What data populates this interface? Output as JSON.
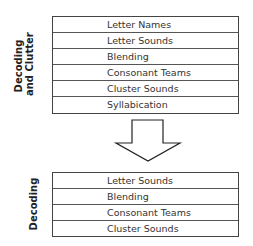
{
  "top_group": {
    "label_line1": "Decoding",
    "label_line2": "and Clutter",
    "rows": [
      "Letter Names",
      "Letter Sounds",
      "Blending",
      "Consonant Teams",
      "Cluster Sounds",
      "Syllabication"
    ]
  },
  "bottom_group": {
    "label": "Decoding",
    "rows": [
      "Letter Sounds",
      "Blending",
      "Consonant Teams",
      "Cluster Sounds"
    ]
  },
  "arrow": {
    "direction": "down",
    "meaning": "transition"
  }
}
